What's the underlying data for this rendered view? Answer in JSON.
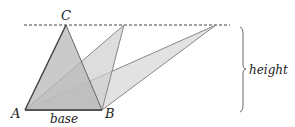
{
  "diagram": {
    "labels": {
      "A": "A",
      "B": "B",
      "C": "C",
      "base": "base",
      "height": "height"
    },
    "points": {
      "A": [
        25,
        110
      ],
      "B": [
        102,
        110
      ],
      "C": [
        66,
        25
      ],
      "apex2": [
        124,
        25
      ],
      "apex3": [
        216,
        25
      ]
    },
    "colors": {
      "fill": "#bdbdbd",
      "stroke": "#555555",
      "dashed_line": "#444444"
    }
  }
}
